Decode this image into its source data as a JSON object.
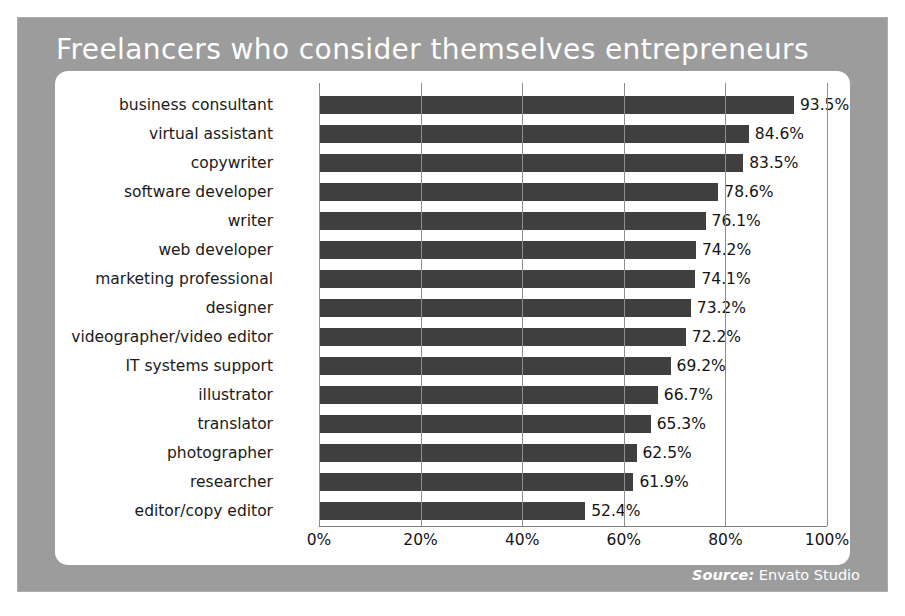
{
  "title": "Freelancers who consider themselves entrepreneurs",
  "source": {
    "prefix": "Source:",
    "name": "Envato Studio"
  },
  "colors": {
    "frame": "#9c9c9c",
    "panel": "#ffffff",
    "bar": "#3f3f3f",
    "title_text": "#ffffff",
    "axis": "#8e8e8e"
  },
  "chart_data": {
    "type": "bar",
    "orientation": "horizontal",
    "title": "Freelancers who consider themselves entrepreneurs",
    "xlabel": "",
    "ylabel": "",
    "xlim": [
      0,
      100
    ],
    "grid": true,
    "legend": false,
    "value_suffix": "%",
    "categories": [
      "business consultant",
      "virtual assistant",
      "copywriter",
      "software developer",
      "writer",
      "web developer",
      "marketing professional",
      "designer",
      "videographer/video editor",
      "IT systems support",
      "illustrator",
      "translator",
      "photographer",
      "researcher",
      "editor/copy editor"
    ],
    "values": [
      93.5,
      84.6,
      83.5,
      78.6,
      76.1,
      74.2,
      74.1,
      73.2,
      72.2,
      69.2,
      66.7,
      65.3,
      62.5,
      61.9,
      52.4
    ],
    "value_labels": [
      "93.5%",
      "84.6%",
      "83.5%",
      "78.6%",
      "76.1%",
      "74.2%",
      "74.1%",
      "73.2%",
      "72.2%",
      "69.2%",
      "66.7%",
      "65.3%",
      "62.5%",
      "61.9%",
      "52.4%"
    ],
    "xticks": [
      0,
      20,
      40,
      60,
      80,
      100
    ],
    "xtick_labels": [
      "0%",
      "20%",
      "40%",
      "60%",
      "80%",
      "100%"
    ]
  }
}
